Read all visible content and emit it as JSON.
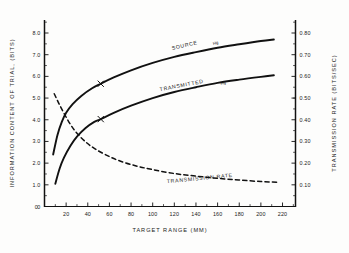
{
  "chart_data": {
    "type": "line",
    "title": "",
    "xlabel": "TARGET RANGE  (MM)",
    "ylabel": "INFORMATION  CONTENT  OF  TRIAL,  (BITS)",
    "y2label": "TRANSMISSION  RATE  (BITS/SEC)",
    "xlim": [
      0,
      232
    ],
    "ylim": [
      0,
      8.6
    ],
    "y2lim": [
      0,
      0.86
    ],
    "grid": false,
    "legend": "inline-curve-labels",
    "xticks": [
      20,
      40,
      60,
      80,
      100,
      120,
      140,
      160,
      180,
      200,
      220
    ],
    "xticklabels": [
      "20",
      "40",
      "60",
      "80",
      "100",
      "120",
      "140",
      "160",
      "180",
      "200",
      "220"
    ],
    "x_origin_label": "0",
    "yticks": [
      0,
      1.0,
      2.0,
      3.0,
      4.0,
      5.0,
      6.0,
      7.0,
      8.0
    ],
    "yticklabels": [
      "0",
      "1.0",
      "2.0",
      "3.0",
      "4.0",
      "5.0",
      "6.0",
      "7.0",
      "8.0"
    ],
    "y2ticks": [
      0.1,
      0.2,
      0.3,
      0.4,
      0.5,
      0.6,
      0.7,
      0.8
    ],
    "y2ticklabels": [
      "0.10",
      "0.20",
      "0.30",
      "0.40",
      "0.50",
      "0.60",
      "0.70",
      "0.80"
    ],
    "series": [
      {
        "name": "SOURCE Hg",
        "label": "SOURCE",
        "sublabel": "Hg",
        "style": "solid",
        "axis": "left",
        "color": "#111111",
        "x": [
          8,
          12,
          16,
          20,
          26,
          34,
          44,
          52,
          64,
          80,
          100,
          120,
          140,
          160,
          180,
          200,
          212
        ],
        "y": [
          2.4,
          3.3,
          3.9,
          4.32,
          4.72,
          5.1,
          5.45,
          5.66,
          5.95,
          6.28,
          6.62,
          6.9,
          7.12,
          7.32,
          7.48,
          7.63,
          7.7
        ]
      },
      {
        "name": "TRANSMITTED Hg",
        "label": "TRANSMITTED",
        "sublabel": "Hg",
        "style": "solid",
        "axis": "left",
        "color": "#111111",
        "x": [
          10,
          14,
          18,
          24,
          30,
          38,
          46,
          52,
          64,
          80,
          100,
          120,
          140,
          160,
          180,
          200,
          212
        ],
        "y": [
          1.05,
          1.75,
          2.25,
          2.8,
          3.22,
          3.62,
          3.9,
          4.03,
          4.32,
          4.65,
          5.0,
          5.28,
          5.5,
          5.7,
          5.85,
          5.98,
          6.05
        ]
      },
      {
        "name": "TRANSMISSION RATE",
        "label": "TRANSMISSION  RATE",
        "sublabel": "",
        "style": "dashed",
        "axis": "right",
        "color": "#111111",
        "x": [
          9,
          13,
          18,
          24,
          30,
          38,
          46,
          56,
          68,
          84,
          100,
          120,
          140,
          160,
          180,
          200,
          215
        ],
        "y": [
          0.52,
          0.478,
          0.43,
          0.378,
          0.338,
          0.298,
          0.268,
          0.24,
          0.213,
          0.188,
          0.17,
          0.152,
          0.14,
          0.13,
          0.122,
          0.115,
          0.112
        ]
      }
    ],
    "markers": [
      {
        "series": "SOURCE Hg",
        "symbol": "x",
        "x": 52,
        "y": 5.66
      },
      {
        "series": "TRANSMITTED Hg",
        "symbol": "x",
        "x": 52,
        "y": 4.03
      }
    ]
  }
}
